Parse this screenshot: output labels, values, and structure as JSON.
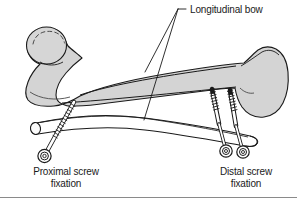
{
  "figure": {
    "title_alt": "Femoral intramedullary nail longitudinal bow with proximal and distal screw fixation",
    "background_color": "#ffffff",
    "bone_fill_color": "#d4d4d4",
    "bone_fill_light": "#e2e2e2",
    "outline_color": "#1a1a1a",
    "nail_fill_color": "#ffffff",
    "screw_fill_color": "#ffffff",
    "border_color": "#8a8a8a"
  },
  "labels": {
    "longitudinal_bow": "Longitudinal bow",
    "proximal_line1": "Proximal screw",
    "proximal_line2": "fixation",
    "distal_line1": "Distal screw",
    "distal_line2": "fixation"
  },
  "anatomy": {
    "bone_name": "femur",
    "proximal_parts": [
      "femoral-head",
      "femoral-neck",
      "greater-trochanter"
    ],
    "distal_parts": [
      "femoral-condyles"
    ],
    "implant": "intramedullary-nail"
  },
  "implants": {
    "nail": {
      "name": "intramedullary-nail",
      "curved": true
    },
    "proximal_screws": [
      {
        "id": "proximal-screw-1",
        "orientation": "oblique"
      }
    ],
    "distal_screws": [
      {
        "id": "distal-screw-1",
        "orientation": "vertical"
      },
      {
        "id": "distal-screw-2",
        "orientation": "vertical"
      }
    ]
  },
  "leader_lines": {
    "count": 2,
    "from": "longitudinal-bow-label",
    "to": [
      "bone-shaft-bow",
      "nail-shaft-bow"
    ]
  }
}
